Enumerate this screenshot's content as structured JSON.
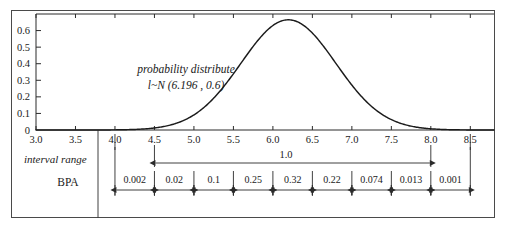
{
  "chart_data": {
    "type": "line",
    "title": "",
    "xlabel": "",
    "ylabel": "",
    "xlim": [
      3.0,
      8.8
    ],
    "ylim": [
      0,
      0.7
    ],
    "grid": false,
    "legend": "none",
    "distribution": {
      "family": "normal",
      "mean": 6.196,
      "sigma": 0.6,
      "peak_x": 6.196,
      "peak_y": 0.665
    },
    "annotations": [
      {
        "name": "distribution-caption-line1",
        "text": "probability distribute",
        "x": 5.05,
        "y": 0.34
      },
      {
        "name": "distribution-caption-line2",
        "text": "l~N (6.196 , 0.6)",
        "x": 5.05,
        "y": 0.24
      },
      {
        "name": "interval-total-label",
        "text": "1.0",
        "x": 6.25,
        "y": -0.075
      }
    ],
    "x_ticks": [
      "3.0",
      "3.5",
      "4.0",
      "4.5",
      "5.0",
      "5.5",
      "6.0",
      "6.5",
      "7.0",
      "7.5",
      "8.0",
      "8.5"
    ],
    "x_tick_values": [
      3.0,
      3.5,
      4.0,
      4.5,
      5.0,
      5.5,
      6.0,
      6.5,
      7.0,
      7.5,
      8.0,
      8.5
    ],
    "y_ticks": [
      "0",
      "0.1",
      "0.2",
      "0.3",
      "0.4",
      "0.5",
      "0.6"
    ],
    "y_tick_values": [
      0,
      0.1,
      0.2,
      0.3,
      0.4,
      0.5,
      0.6
    ],
    "series": [
      {
        "name": "probability density",
        "points_x": [
          3.0,
          3.2,
          3.4,
          3.6,
          3.8,
          4.0,
          4.2,
          4.4,
          4.6,
          4.8,
          5.0,
          5.2,
          5.4,
          5.6,
          5.8,
          6.0,
          6.196,
          6.4,
          6.6,
          6.8,
          7.0,
          7.2,
          7.4,
          7.6,
          7.8,
          8.0,
          8.2,
          8.4,
          8.6,
          8.8
        ],
        "points_y": [
          0.0,
          0.0,
          0.0001,
          0.0002,
          0.0007,
          0.0022,
          0.0062,
          0.0154,
          0.034,
          0.0669,
          0.1172,
          0.1838,
          0.2583,
          0.3257,
          0.3688,
          0.3752,
          0.665,
          0.3577,
          0.303,
          0.2316,
          0.1588,
          0.0977,
          0.0539,
          0.0266,
          0.0118,
          0.0047,
          0.0017,
          0.0005,
          0.0001,
          0.0
        ]
      }
    ],
    "interval_dimension": {
      "label": "1.0",
      "from_x": 4.5,
      "to_x": 8.0
    },
    "interval_table": {
      "row_labels": [
        "interval range",
        "BPA"
      ],
      "segment_boundaries": [
        4.0,
        4.5,
        5.0,
        5.5,
        6.0,
        6.5,
        7.0,
        7.5,
        8.0,
        8.5
      ],
      "bpa_values": [
        "0.002",
        "0.02",
        "0.1",
        "0.25",
        "0.32",
        "0.22",
        "0.074",
        "0.013",
        "0.001"
      ]
    },
    "colors": {
      "curve": "#1b1b1b",
      "axis": "#2b2b2b",
      "frame": "#4a4a4a",
      "background": "#ffffff",
      "text": "#1a1a1a"
    }
  }
}
